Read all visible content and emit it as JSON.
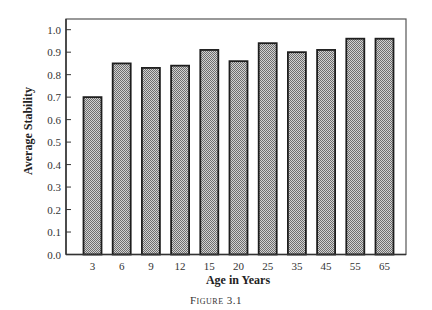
{
  "caption": "Figure 3.1",
  "colors": {
    "bar_fill": "#a3a3a3",
    "bar_pattern_dark": "#6e6e6e",
    "bar_pattern_light": "#d2d2d2",
    "bar_outline": "#1e1e1e",
    "axis": "#333333",
    "frame": "#555555"
  },
  "chart_data": {
    "type": "bar",
    "title": "",
    "caption": "Figure 3.1",
    "xlabel": "Age in Years",
    "ylabel": "Average Stability",
    "categories": [
      "3",
      "6",
      "9",
      "12",
      "15",
      "20",
      "25",
      "35",
      "45",
      "55",
      "65"
    ],
    "values": [
      0.7,
      0.85,
      0.83,
      0.84,
      0.91,
      0.86,
      0.94,
      0.9,
      0.91,
      0.96,
      0.96
    ],
    "ylim": [
      0.0,
      1.0
    ],
    "yticks": [
      "0.0",
      "0.1",
      "0.2",
      "0.3",
      "0.4",
      "0.5",
      "0.6",
      "0.7",
      "0.8",
      "0.9",
      "1.0"
    ],
    "grid": false,
    "legend": null
  }
}
